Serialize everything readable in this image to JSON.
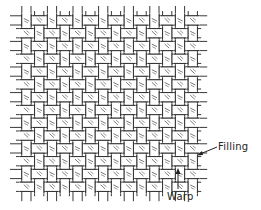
{
  "diagram": {
    "type": "plain-weave",
    "labels": {
      "filling": "Filling",
      "warp": "Warp"
    },
    "grid": {
      "warp_count": 14,
      "filling_count": 14,
      "origin_x": 20,
      "origin_y": 14,
      "cell": 12.8
    },
    "colors": {
      "ink": "#222222",
      "paper": "#ffffff",
      "hatch": "#555555"
    }
  }
}
